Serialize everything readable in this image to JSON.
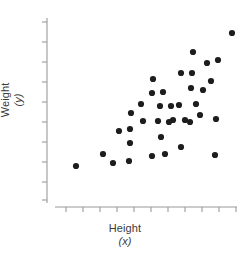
{
  "chart_data": {
    "type": "scatter",
    "title": "",
    "xlabel": "Height",
    "xlabel_variable": "(x)",
    "ylabel": "Weight",
    "ylabel_variable": "(y)",
    "grid": false,
    "legend": null,
    "tick_labels_shown": false,
    "dot_color": "#1d1d1d",
    "axis_color": "#9a9a9a",
    "dot_radius_px": 3.1,
    "x_tick_count": 11,
    "y_tick_count": 10,
    "xlim": [
      0,
      11
    ],
    "ylim": [
      0,
      10
    ],
    "axis_pixel_frame": {
      "x_axis_y": 207,
      "y_axis_x": 47,
      "y_axis_top": 18,
      "x_axis_right": 237
    },
    "x_tick_positions_px": [
      66,
      83,
      100,
      117,
      134,
      151,
      168,
      185,
      202,
      219,
      236
    ],
    "y_tick_positions_px": [
      22,
      42,
      62,
      82,
      102,
      122,
      142,
      162,
      182,
      200
    ],
    "points_px": [
      {
        "x": 76,
        "y": 166
      },
      {
        "x": 103,
        "y": 154
      },
      {
        "x": 113,
        "y": 163
      },
      {
        "x": 130,
        "y": 143
      },
      {
        "x": 130,
        "y": 129
      },
      {
        "x": 131,
        "y": 113
      },
      {
        "x": 129,
        "y": 161
      },
      {
        "x": 141,
        "y": 104
      },
      {
        "x": 152,
        "y": 156
      },
      {
        "x": 152,
        "y": 93
      },
      {
        "x": 153,
        "y": 79
      },
      {
        "x": 158,
        "y": 121
      },
      {
        "x": 160,
        "y": 106
      },
      {
        "x": 161,
        "y": 137
      },
      {
        "x": 163,
        "y": 92
      },
      {
        "x": 169,
        "y": 122
      },
      {
        "x": 171,
        "y": 106
      },
      {
        "x": 173,
        "y": 120
      },
      {
        "x": 179,
        "y": 105
      },
      {
        "x": 181,
        "y": 147
      },
      {
        "x": 181,
        "y": 73
      },
      {
        "x": 185,
        "y": 120
      },
      {
        "x": 190,
        "y": 122
      },
      {
        "x": 191,
        "y": 88
      },
      {
        "x": 192,
        "y": 73
      },
      {
        "x": 193,
        "y": 52
      },
      {
        "x": 200,
        "y": 115
      },
      {
        "x": 203,
        "y": 90
      },
      {
        "x": 207,
        "y": 63
      },
      {
        "x": 211,
        "y": 81
      },
      {
        "x": 215,
        "y": 155
      },
      {
        "x": 216,
        "y": 119
      },
      {
        "x": 218,
        "y": 60
      },
      {
        "x": 232,
        "y": 33
      },
      {
        "x": 143,
        "y": 121
      },
      {
        "x": 119,
        "y": 131
      },
      {
        "x": 165,
        "y": 154
      },
      {
        "x": 196,
        "y": 104
      }
    ]
  }
}
